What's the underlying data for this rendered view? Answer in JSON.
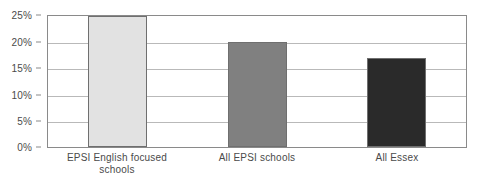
{
  "chart_data": {
    "type": "bar",
    "title": "",
    "subtitle": "",
    "xlabel": "",
    "ylabel": "",
    "categories": [
      "EPSI English focused schools",
      "All EPSI schools",
      "All Essex"
    ],
    "values": [
      25,
      20,
      17
    ],
    "value_labels": [
      "25%",
      "20%",
      "17%"
    ],
    "ylim": [
      0,
      25
    ],
    "y_ticks": [
      0,
      5,
      10,
      15,
      20,
      25
    ],
    "y_tick_labels": [
      "0%",
      "5%",
      "10%",
      "15%",
      "20%",
      "25%"
    ],
    "grid": true,
    "legend": false,
    "legend_position": "none",
    "series": [
      {
        "name": "",
        "values": [
          25,
          20,
          17
        ],
        "colors": [
          "#e2e2e2",
          "#808080",
          "#2a2a2a"
        ]
      }
    ],
    "bar_colors": [
      "#e2e2e2",
      "#808080",
      "#2a2a2a"
    ],
    "bar_border_color": "#6f6f6f",
    "gridline_color": "#b9b9b9",
    "frame_color": "#8a8a8a",
    "text_color": "#4a4a4a",
    "background": "#ffffff"
  },
  "axis": {
    "y_labels": [
      {
        "text": "25%",
        "value": 25
      },
      {
        "text": "20%",
        "value": 20
      },
      {
        "text": "15%",
        "value": 15
      },
      {
        "text": "10%",
        "value": 10
      },
      {
        "text": "5%",
        "value": 5
      },
      {
        "text": "0%",
        "value": 0
      }
    ],
    "x_labels": [
      {
        "line1": "EPSI English focused",
        "line2": "schools"
      },
      {
        "line1": "All EPSI schools",
        "line2": ""
      },
      {
        "line1": "All Essex",
        "line2": ""
      }
    ]
  }
}
